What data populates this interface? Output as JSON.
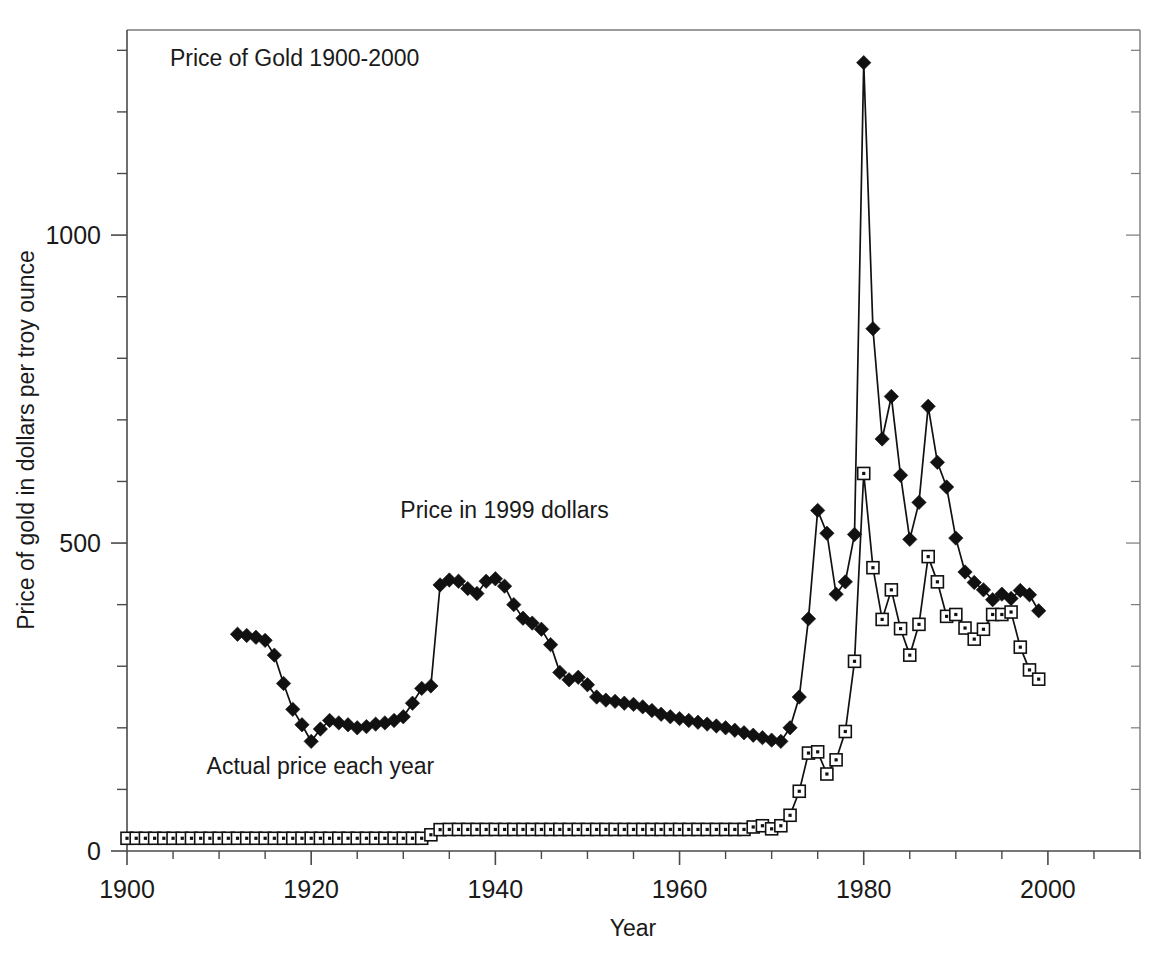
{
  "chart_data": {
    "type": "line",
    "title": "Price of Gold 1900-2000",
    "xlabel": "Year",
    "ylabel": "Price of gold in dollars per troy ounce",
    "xlim": [
      1900,
      2010
    ],
    "ylim": [
      0,
      1333
    ],
    "grid": false,
    "legend_position": "inline-annotations",
    "x_ticks_major": [
      "1900",
      "1920",
      "1940",
      "1960",
      "1980",
      "2000"
    ],
    "x_ticks_major_values": [
      1900,
      1920,
      1940,
      1960,
      1980,
      2000
    ],
    "x_tick_minor_step": 5,
    "y_ticks_major": [
      "0",
      "500",
      "1000"
    ],
    "y_ticks_major_values": [
      0,
      500,
      1000
    ],
    "y_tick_minor_step": 100,
    "annotations": [
      {
        "text": "Price in 1999 dollars",
        "x": 1941,
        "y": 540
      },
      {
        "text": "Actual price each year",
        "x": 1921,
        "y": 125
      }
    ],
    "series": [
      {
        "name": "Price in 1999 dollars",
        "marker": "diamond",
        "x": [
          1912,
          1913,
          1914,
          1915,
          1916,
          1917,
          1918,
          1919,
          1920,
          1921,
          1922,
          1923,
          1924,
          1925,
          1926,
          1927,
          1928,
          1929,
          1930,
          1931,
          1932,
          1933,
          1934,
          1935,
          1936,
          1937,
          1938,
          1939,
          1940,
          1941,
          1942,
          1943,
          1944,
          1945,
          1946,
          1947,
          1948,
          1949,
          1950,
          1951,
          1952,
          1953,
          1954,
          1955,
          1956,
          1957,
          1958,
          1959,
          1960,
          1961,
          1962,
          1963,
          1964,
          1965,
          1966,
          1967,
          1968,
          1969,
          1970,
          1971,
          1972,
          1973,
          1974,
          1975,
          1976,
          1977,
          1978,
          1979,
          1980,
          1981,
          1982,
          1983,
          1984,
          1985,
          1986,
          1987,
          1988,
          1989,
          1990,
          1991,
          1992,
          1993,
          1994,
          1995,
          1996,
          1997,
          1998,
          1999
        ],
        "values": [
          352,
          350,
          347,
          342,
          318,
          272,
          230,
          205,
          178,
          198,
          212,
          208,
          205,
          200,
          202,
          206,
          208,
          212,
          218,
          240,
          264,
          268,
          432,
          440,
          438,
          426,
          418,
          438,
          442,
          430,
          400,
          378,
          370,
          360,
          335,
          290,
          278,
          282,
          270,
          250,
          245,
          243,
          240,
          238,
          234,
          228,
          222,
          218,
          215,
          212,
          209,
          206,
          203,
          200,
          196,
          192,
          188,
          184,
          180,
          178,
          200,
          250,
          377,
          553,
          516,
          417,
          437,
          514,
          1280,
          848,
          669,
          738,
          610,
          506,
          566,
          722,
          631,
          591,
          508,
          453,
          436,
          424,
          408,
          417,
          410,
          423,
          416,
          390
        ],
        "units": "1999 US dollars per troy ounce"
      },
      {
        "name": "Actual price each year",
        "marker": "square",
        "x": [
          1900,
          1901,
          1902,
          1903,
          1904,
          1905,
          1906,
          1907,
          1908,
          1909,
          1910,
          1911,
          1912,
          1913,
          1914,
          1915,
          1916,
          1917,
          1918,
          1919,
          1920,
          1921,
          1922,
          1923,
          1924,
          1925,
          1926,
          1927,
          1928,
          1929,
          1930,
          1931,
          1932,
          1933,
          1934,
          1935,
          1936,
          1937,
          1938,
          1939,
          1940,
          1941,
          1942,
          1943,
          1944,
          1945,
          1946,
          1947,
          1948,
          1949,
          1950,
          1951,
          1952,
          1953,
          1954,
          1955,
          1956,
          1957,
          1958,
          1959,
          1960,
          1961,
          1962,
          1963,
          1964,
          1965,
          1966,
          1967,
          1968,
          1969,
          1970,
          1971,
          1972,
          1973,
          1974,
          1975,
          1976,
          1977,
          1978,
          1979,
          1980,
          1981,
          1982,
          1983,
          1984,
          1985,
          1986,
          1987,
          1988,
          1989,
          1990,
          1991,
          1992,
          1993,
          1994,
          1995,
          1996,
          1997,
          1998,
          1999
        ],
        "values": [
          20.67,
          20.67,
          20.67,
          20.67,
          20.67,
          20.67,
          20.67,
          20.67,
          20.67,
          20.67,
          20.67,
          20.67,
          20.67,
          20.67,
          20.67,
          20.67,
          20.67,
          20.67,
          20.67,
          20.67,
          20.67,
          20.67,
          20.67,
          20.67,
          20.67,
          20.67,
          20.67,
          20.67,
          20.67,
          20.67,
          20.67,
          20.67,
          20.67,
          26.33,
          34.69,
          35,
          35,
          35,
          35,
          35,
          35,
          35,
          35,
          35,
          35,
          35,
          35,
          35,
          35,
          35,
          35,
          35,
          35,
          35,
          35,
          35,
          35,
          35,
          35,
          35,
          35,
          35,
          35,
          35,
          35,
          35,
          35,
          35,
          39,
          41,
          36,
          41,
          58,
          97,
          159,
          161,
          125,
          148,
          194,
          308,
          613,
          460,
          376,
          424,
          361,
          318,
          368,
          478,
          437,
          381,
          384,
          362,
          344,
          360,
          384,
          384,
          388,
          331,
          294,
          279
        ],
        "units": "nominal US dollars per troy ounce"
      }
    ]
  },
  "axis": {
    "x_title": "Year",
    "y_title": "Price of gold in dollars per troy ounce"
  },
  "colors": {
    "series_line": "#111111",
    "marker_fill": "#111111",
    "marker_open_fill": "#ffffff",
    "axis": "#4a4a4a",
    "frame": "#7a7a7a",
    "text": "#1a1a1a",
    "background": "#ffffff"
  }
}
